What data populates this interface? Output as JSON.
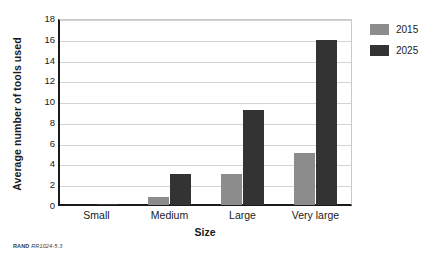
{
  "chart_data": {
    "type": "bar",
    "title": "",
    "subtitle": "",
    "xlabel": "Size",
    "ylabel": "Average number of tools used",
    "categories": [
      "Small",
      "Medium",
      "Large",
      "Very large"
    ],
    "series": [
      {
        "name": "2015",
        "color": "#8c8c8c",
        "values": [
          0,
          0.8,
          3.0,
          5.0
        ]
      },
      {
        "name": "2025",
        "color": "#333333",
        "values": [
          0.1,
          3.0,
          9.2,
          16.0
        ]
      }
    ],
    "ylim": [
      0,
      18
    ],
    "yticks": [
      0,
      2,
      4,
      6,
      8,
      10,
      12,
      14,
      16,
      18
    ],
    "ytick_labels": [
      "0",
      "2",
      "4",
      "6",
      "8",
      "10",
      "12",
      "14",
      "16",
      "18"
    ],
    "grid": true,
    "grid_axis": "y",
    "legend_position": "right",
    "annotations": []
  },
  "legend": {
    "entries": [
      {
        "label": "2015",
        "color": "#8c8c8c"
      },
      {
        "label": "2025",
        "color": "#333333"
      }
    ]
  },
  "axes": {
    "y_title": "Average number of tools used",
    "x_title": "Size"
  },
  "footer": {
    "organization": "RAND",
    "identifier": "RR1024-5.3"
  },
  "colors": {
    "series_2015": "#8c8c8c",
    "series_2025": "#333333",
    "axis": "#1a1a1a",
    "gridline": "#d4d4d4",
    "background": "#ffffff"
  }
}
